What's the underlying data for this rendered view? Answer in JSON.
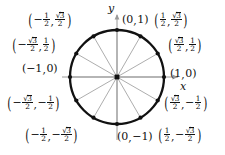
{
  "diagram": {
    "background_color": "#ffffff",
    "circle_color": "#111111",
    "spoke_color": "#8a8a8a",
    "axis_color": "#9a9a9a",
    "point_color": "#111111",
    "center": {
      "x": 117,
      "y": 77
    },
    "radius": 47,
    "axes": {
      "x_label": "x",
      "y_label": "y"
    },
    "points": [
      {
        "angle_deg": 0,
        "label": "(1, 0)",
        "x_text": "1",
        "y_text": "0"
      },
      {
        "angle_deg": 30,
        "label": "(√3/2, 1/2)",
        "x_text": "√3/2",
        "y_text": "1/2"
      },
      {
        "angle_deg": 60,
        "label": "(1/2, √3/2)",
        "x_text": "1/2",
        "y_text": "√3/2"
      },
      {
        "angle_deg": 90,
        "label": "(0, 1)",
        "x_text": "0",
        "y_text": "1"
      },
      {
        "angle_deg": 120,
        "label": "(−1/2, √3/2)",
        "x_text": "−1/2",
        "y_text": "√3/2"
      },
      {
        "angle_deg": 150,
        "label": "(−√3/2, 1/2)",
        "x_text": "−√3/2",
        "y_text": "1/2"
      },
      {
        "angle_deg": 180,
        "label": "(−1, 0)",
        "x_text": "−1",
        "y_text": "0"
      },
      {
        "angle_deg": 210,
        "label": "(−√3/2, −1/2)",
        "x_text": "−√3/2",
        "y_text": "−1/2"
      },
      {
        "angle_deg": 240,
        "label": "(−1/2, −√3/2)",
        "x_text": "−1/2",
        "y_text": "−√3/2"
      },
      {
        "angle_deg": 270,
        "label": "(0, −1)",
        "x_text": "0",
        "y_text": "−1"
      },
      {
        "angle_deg": 300,
        "label": "(1/2, −√3/2)",
        "x_text": "1/2",
        "y_text": "−√3/2"
      },
      {
        "angle_deg": 330,
        "label": "(√3/2, −1/2)",
        "x_text": "√3/2",
        "y_text": "−1/2"
      }
    ],
    "labels": {
      "top_left": "(−1/2, √3/2)",
      "top_center": "(0, 1)",
      "top_right": "(1/2, √3/2)",
      "upper_left": "(−√3/2, 1/2)",
      "upper_right": "(√3/2, 1/2)",
      "left": "(−1, 0)",
      "right": "(1, 0)",
      "lower_left": "(−√3/2, −1/2)",
      "lower_right": "(√3/2, −1/2)",
      "bottom_left": "(−1/2, −√3/2)",
      "bottom_center": "(0, −1)",
      "bottom_right": "(1/2, −√3/2)"
    }
  }
}
